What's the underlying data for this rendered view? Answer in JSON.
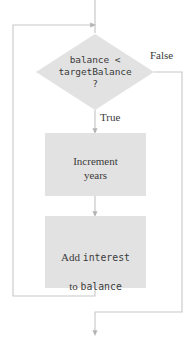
{
  "diagram": {
    "type": "flowchart",
    "title": "",
    "colors": {
      "shape_fill": "#e2e2e2",
      "line": "#b0b0b0",
      "text": "#3a3a3a",
      "background": "#ffffff"
    },
    "nodes": [
      {
        "id": "decision",
        "shape": "diamond",
        "text": "balance <\ntargetBalance\n?",
        "font": "monospace"
      },
      {
        "id": "process-increment-years",
        "shape": "rectangle",
        "text": "Increment\nyears",
        "font": "serif"
      },
      {
        "id": "process-add-interest",
        "shape": "rectangle",
        "line1_prefix": "Add ",
        "line1_code": "interest",
        "line2_prefix": "to ",
        "line2_code": "balance",
        "font": "mixed"
      }
    ],
    "edges": [
      {
        "id": "edge-true",
        "label": "True",
        "from": "decision",
        "to": "process-increment-years"
      },
      {
        "id": "edge-false",
        "label": "False",
        "from": "decision",
        "to": "exit"
      },
      {
        "id": "edge-sequence",
        "label": "",
        "from": "process-increment-years",
        "to": "process-add-interest"
      },
      {
        "id": "edge-loopback",
        "label": "",
        "from": "process-add-interest",
        "to": "decision"
      },
      {
        "id": "edge-entry",
        "label": "",
        "from": "start",
        "to": "decision"
      }
    ]
  }
}
